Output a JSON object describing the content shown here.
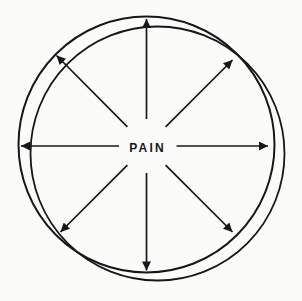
{
  "diagram": {
    "center_label": "PAIN",
    "line_color": "#171717",
    "label_color": "#171717",
    "background_color": "#fbfbfa",
    "arrow_directions": [
      "up",
      "up-right",
      "right",
      "down-right",
      "down",
      "down-left",
      "left",
      "up-left"
    ]
  }
}
